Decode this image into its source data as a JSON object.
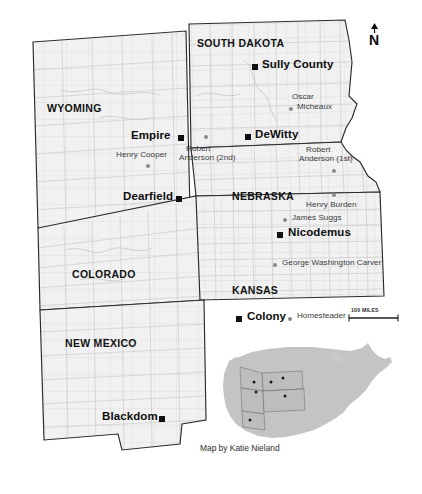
{
  "figure": {
    "credit": "Map by Katie Nieland",
    "north_label": "N"
  },
  "colors": {
    "land_fill": "#f1f1f1",
    "state_border": "#2b2b2b",
    "county_border": "#cfcfcf",
    "colony_marker": "#111111",
    "homesteader_marker": "#8a8a8a",
    "inset_land": "#c4c4c4",
    "background": "#ffffff"
  },
  "states": [
    {
      "name": "WYOMING",
      "x": 47,
      "y": 103
    },
    {
      "name": "SOUTH DAKOTA",
      "x": 197,
      "y": 38
    },
    {
      "name": "NEBRASKA",
      "x": 232,
      "y": 191
    },
    {
      "name": "COLORADO",
      "x": 72,
      "y": 269
    },
    {
      "name": "KANSAS",
      "x": 232,
      "y": 285
    },
    {
      "name": "NEW MEXICO",
      "x": 65,
      "y": 338
    }
  ],
  "colonies": [
    {
      "name": "Sully County",
      "label_x": 260,
      "label_y": 60,
      "marker_x": 252,
      "marker_y": 64,
      "marker_side": "left"
    },
    {
      "name": "Empire",
      "label_x": 131,
      "label_y": 131,
      "marker_x": 178,
      "marker_y": 135,
      "marker_side": "right"
    },
    {
      "name": "DeWitty",
      "label_x": 253,
      "label_y": 130,
      "marker_x": 245,
      "marker_y": 134,
      "marker_side": "left"
    },
    {
      "name": "Dearfield",
      "label_x": 123,
      "label_y": 192,
      "marker_x": 176,
      "marker_y": 196,
      "marker_side": "right"
    },
    {
      "name": "Nicodemus",
      "label_x": 288,
      "label_y": 228,
      "marker_x": 277,
      "marker_y": 232,
      "marker_side": "left"
    },
    {
      "name": "Blackdom",
      "label_x": 102,
      "label_y": 412,
      "marker_x": 159,
      "marker_y": 416,
      "marker_side": "right"
    }
  ],
  "homesteaders": [
    {
      "name": "Oscar\nMicheaux",
      "lines": [
        "Oscar",
        "Micheaux"
      ],
      "label_x": 296,
      "label_y": 95,
      "marker_x": 290,
      "marker_y": 108,
      "align": "left"
    },
    {
      "name": "Henry Cooper",
      "lines": [
        "Henry Cooper"
      ],
      "label_x": 118,
      "label_y": 153,
      "marker_x": 147,
      "marker_y": 165,
      "align": "left"
    },
    {
      "name": "Robert\nAnderson (2nd)",
      "lines": [
        "Robert",
        "Anderson (2nd)"
      ],
      "label_x": 186,
      "label_y": 147,
      "marker_x": 205,
      "marker_y": 136,
      "align": "left"
    },
    {
      "name": "Robert\nAnderson (1st)",
      "lines": [
        "Robert",
        "Anderson (1st)"
      ],
      "label_x": 305,
      "label_y": 148,
      "marker_x": 334,
      "marker_y": 170,
      "align": "left"
    },
    {
      "name": "Henry Burden",
      "lines": [
        "Henry Burden"
      ],
      "label_x": 308,
      "label_y": 203,
      "marker_x": 334,
      "marker_y": 194,
      "align": "left"
    },
    {
      "name": "James Suggs",
      "lines": [
        "James Suggs"
      ],
      "label_x": 292,
      "label_y": 215,
      "marker_x": 283,
      "marker_y": 218,
      "align": "left"
    },
    {
      "name": "George Washington Carver",
      "lines": [
        "George Washington Carver"
      ],
      "label_x": 283,
      "label_y": 260,
      "marker_x": 273,
      "marker_y": 263,
      "align": "left"
    }
  ],
  "legend": {
    "colony_label": "Colony",
    "homesteader_label": "Homesteader",
    "scale_label": "100 MILES",
    "colony_marker_x": 236,
    "colony_marker_y": 316,
    "colony_text_x": 246,
    "colony_text_y": 310,
    "home_marker_x": 288,
    "home_marker_y": 317,
    "home_text_x": 296,
    "home_text_y": 312,
    "scale_x": 351,
    "scale_y": 309,
    "scale_bar_x": 349,
    "scale_bar_y": 318,
    "scale_bar_w": 49
  },
  "inset": {
    "highlighted_states": [
      "Wyoming",
      "South Dakota",
      "Nebraska",
      "Colorado",
      "Kansas",
      "New Mexico"
    ],
    "site_dot_count": 6
  }
}
